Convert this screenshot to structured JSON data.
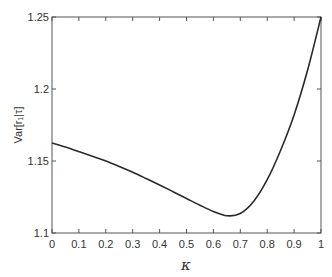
{
  "chart_data": {
    "type": "line",
    "title": "",
    "xlabel": "κ",
    "ylabel": "Var[r₁|τ]",
    "xlim": [
      0,
      1
    ],
    "ylim": [
      1.1,
      1.25
    ],
    "grid": false,
    "legend": null,
    "x_ticks": [
      "0",
      "0.1",
      "0.2",
      "0.3",
      "0.4",
      "0.5",
      "0.6",
      "0.7",
      "0.8",
      "0.9",
      "1"
    ],
    "y_ticks": [
      "1.1",
      "1.15",
      "1.2",
      "1.25"
    ],
    "series": [
      {
        "name": "Var[r1|tau]",
        "color": "#2a2a2a",
        "x": [
          0,
          0.05,
          0.1,
          0.15,
          0.2,
          0.25,
          0.3,
          0.35,
          0.4,
          0.45,
          0.5,
          0.55,
          0.6,
          0.65,
          0.7,
          0.75,
          0.8,
          0.85,
          0.9,
          0.95,
          1.0
        ],
        "y": [
          1.1625,
          1.1597,
          1.1565,
          1.1533,
          1.15,
          1.1462,
          1.1422,
          1.1378,
          1.1333,
          1.1287,
          1.124,
          1.1193,
          1.115,
          1.112,
          1.1135,
          1.122,
          1.137,
          1.1575,
          1.182,
          1.213,
          1.25
        ]
      }
    ]
  }
}
